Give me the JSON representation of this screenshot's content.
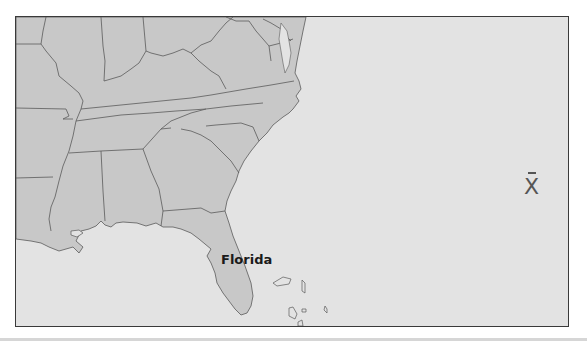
{
  "map": {
    "labels": {
      "florida": "Florida"
    },
    "colors": {
      "land": "#c8c8c8",
      "water": "#e3e3e3",
      "border": "#555555",
      "frame": "#3a3a3a"
    }
  },
  "controls": {
    "close_label": "X"
  }
}
